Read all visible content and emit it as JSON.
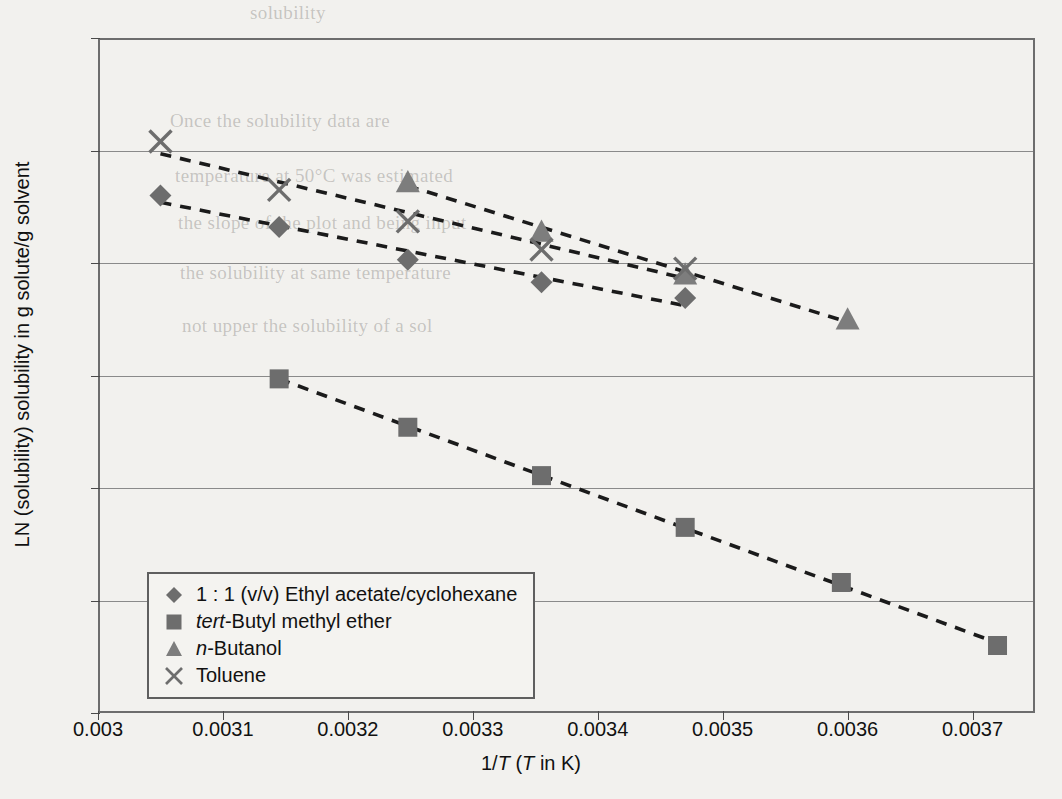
{
  "chart_data": {
    "type": "scatter",
    "title": "",
    "xlabel": "1/T (T in K)",
    "ylabel": "LN (solubility) solubility in g solute/g solvent",
    "xlim": [
      0.003,
      0.00375
    ],
    "ylim": [
      -7,
      -1
    ],
    "grid": true,
    "grid_axis": "y",
    "legend_position": "lower-left-inside",
    "x_ticks": [
      "0.003",
      "0.0031",
      "0.0032",
      "0.0033",
      "0.0034",
      "0.0035",
      "0.0036",
      "0.0037"
    ],
    "x_tick_values": [
      0.003,
      0.0031,
      0.0032,
      0.0033,
      0.0034,
      0.0035,
      0.0036,
      0.0037
    ],
    "y_ticks": [
      "-1",
      "-2",
      "-3",
      "-4",
      "-5",
      "-6",
      "-7"
    ],
    "y_tick_values": [
      -1,
      -2,
      -3,
      -4,
      -5,
      -6,
      -7
    ],
    "series": [
      {
        "name": "1 : 1 (v/v) Ethyl acetate/cyclohexane",
        "marker": "diamond",
        "color": "#6d6d6d",
        "trendline": true,
        "trendline_style": "dashed",
        "points": [
          {
            "x": 0.00305,
            "y": -2.4
          },
          {
            "x": 0.003145,
            "y": -2.68
          },
          {
            "x": 0.003248,
            "y": -2.97
          },
          {
            "x": 0.003355,
            "y": -3.17
          },
          {
            "x": 0.00347,
            "y": -3.31
          }
        ]
      },
      {
        "name": "tert-Butyl methyl ether",
        "marker": "square",
        "color": "#6d6d6d",
        "trendline": true,
        "trendline_style": "dashed",
        "points": [
          {
            "x": 0.003145,
            "y": -4.03
          },
          {
            "x": 0.003248,
            "y": -4.46
          },
          {
            "x": 0.003355,
            "y": -4.89
          },
          {
            "x": 0.00347,
            "y": -5.35
          },
          {
            "x": 0.003595,
            "y": -5.84
          },
          {
            "x": 0.00372,
            "y": -6.4
          }
        ]
      },
      {
        "name": "n-Butanol",
        "marker": "triangle",
        "color": "#7d7d7d",
        "trendline": true,
        "trendline_style": "dashed",
        "points": [
          {
            "x": 0.003248,
            "y": -2.28
          },
          {
            "x": 0.003355,
            "y": -2.72
          },
          {
            "x": 0.00347,
            "y": -3.1
          },
          {
            "x": 0.0036,
            "y": -3.5
          }
        ]
      },
      {
        "name": "Toluene",
        "marker": "cross",
        "color": "#6d6d6d",
        "trendline": true,
        "trendline_style": "dashed",
        "points": [
          {
            "x": 0.00305,
            "y": -1.92
          },
          {
            "x": 0.003145,
            "y": -2.35
          },
          {
            "x": 0.003248,
            "y": -2.63
          },
          {
            "x": 0.003355,
            "y": -2.88
          },
          {
            "x": 0.00347,
            "y": -3.05
          }
        ]
      }
    ]
  },
  "legend": {
    "items": [
      {
        "label_plain": "1 : 1 (v/v) Ethyl acetate/cyclohexane",
        "marker": "diamond"
      },
      {
        "label_plain": "tert-Butyl methyl ether",
        "marker": "square"
      },
      {
        "label_plain": "n-Butanol",
        "marker": "triangle"
      },
      {
        "label_plain": "Toluene",
        "marker": "cross"
      }
    ]
  },
  "background_text": {
    "lines": [
      "solubility",
      "Once the solubility data are",
      "temperature at 50°C was estimated",
      "the slope of the plot and being input",
      "the solubility at the same temperature, when measured",
      "not upper the solubility of a sol"
    ]
  }
}
